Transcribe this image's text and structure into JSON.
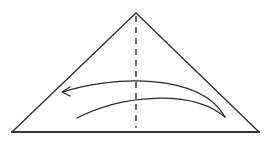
{
  "diagram": {
    "type": "origami-fold-step",
    "shape": "triangle",
    "fold_line": {
      "style": "dashed",
      "kind": "valley-fold",
      "orientation": "vertical-center"
    },
    "arrow": {
      "direction": "right-to-left",
      "meaning": "fold right half over to the left"
    },
    "colors": {
      "line": "#2a2a2a",
      "background": "#ffffff"
    }
  }
}
